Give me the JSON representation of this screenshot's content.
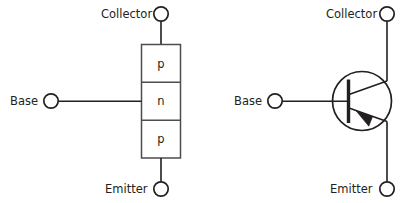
{
  "figure": {
    "stroke_color": "#231f20",
    "box_stroke_color": "#4d4d4f",
    "background_color": "#ffffff"
  },
  "left_diagram": {
    "name": "pnp-layer-structure",
    "terminals": {
      "collector": "Collector",
      "base": "Base",
      "emitter": "Emitter"
    },
    "layers": [
      {
        "label": "p",
        "position": "top",
        "region": "collector"
      },
      {
        "label": "n",
        "position": "middle",
        "region": "base"
      },
      {
        "label": "p",
        "position": "bottom",
        "region": "emitter"
      }
    ]
  },
  "right_diagram": {
    "name": "pnp-schematic-symbol",
    "terminals": {
      "collector": "Collector",
      "base": "Base",
      "emitter": "Emitter"
    },
    "symbol": {
      "type": "pnp-transistor",
      "arrow_on": "emitter",
      "arrow_direction": "inward"
    }
  }
}
